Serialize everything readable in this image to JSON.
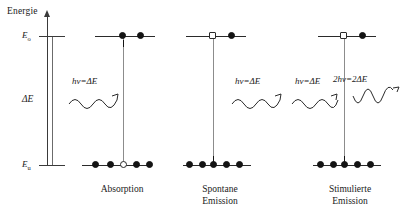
{
  "figure": {
    "axis": {
      "title": "Energie",
      "upper_level_label": "E",
      "upper_level_sub": "o",
      "lower_level_label": "E",
      "lower_level_sub": "u",
      "gap_label": "ΔE"
    },
    "panels": [
      {
        "id": "absorption",
        "caption": "Absorption",
        "photon_in_label": "hν=ΔE",
        "photon_out_label": "",
        "upper_occupancy": [
          "filled",
          "filled"
        ],
        "lower_occupancy": [
          "filled",
          "filled",
          "hollow",
          "filled",
          "filled"
        ],
        "direction": "up"
      },
      {
        "id": "spontaneous-emission",
        "caption": "Spontane\nEmission",
        "photon_in_label": "",
        "photon_out_label": "hν=ΔE",
        "upper_occupancy": [
          "hollow",
          "filled"
        ],
        "lower_occupancy": [
          "filled",
          "filled",
          "filled",
          "filled",
          "filled"
        ],
        "direction": "down"
      },
      {
        "id": "stimulated-emission",
        "caption": "Stimulierte\nEmission",
        "photon_in_label": "hν=ΔE",
        "photon_out_label": "2hν=2ΔE",
        "upper_occupancy": [
          "hollow",
          "filled"
        ],
        "lower_occupancy": [
          "filled",
          "filled",
          "filled",
          "filled",
          "filled"
        ],
        "direction": "down"
      }
    ],
    "colors": {
      "ink": "#141414",
      "axis": "#3a3a3a",
      "transition": "#8c8c8c"
    }
  }
}
